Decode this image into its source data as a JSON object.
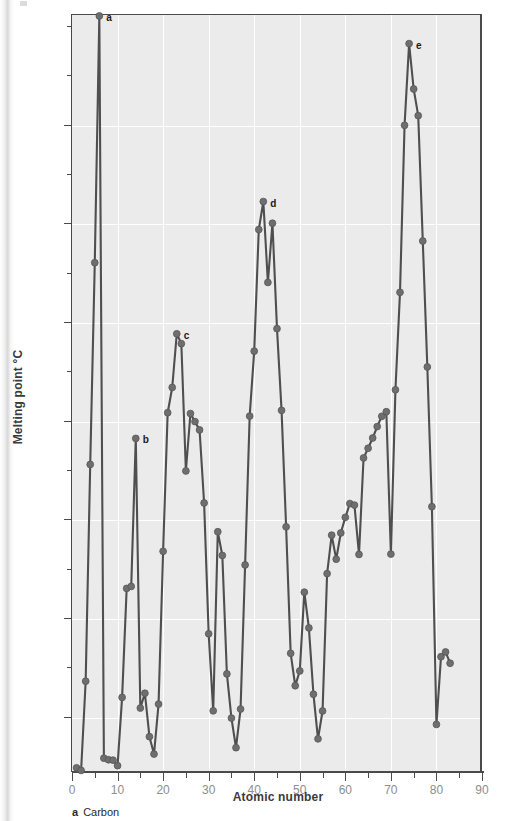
{
  "figure": {
    "caption_key": "a",
    "caption_text": "Carbon"
  },
  "chart_data": {
    "type": "line",
    "title": "",
    "xlabel": "Atomic number",
    "ylabel": "Melting point °C",
    "xlim": [
      0,
      90
    ],
    "ylim": [
      -280,
      3560
    ],
    "grid": true,
    "legend": "none",
    "x_major_ticks": [
      0,
      10,
      20,
      30,
      40,
      50,
      60,
      70,
      80,
      90
    ],
    "x_minor_ticks": [
      5,
      15,
      25,
      35,
      45,
      55,
      65,
      75,
      85
    ],
    "x_tick_labels": [
      "0",
      "10",
      "20",
      "30",
      "40",
      "50",
      "60",
      "70",
      "80",
      "90"
    ],
    "y_major_ticks": [
      0,
      500,
      1000,
      1500,
      2000,
      2500,
      3000
    ],
    "y_minor_ticks": [
      250,
      750,
      1250,
      1750,
      2250,
      2750,
      3250
    ],
    "y_tick_labels": [
      "0",
      "500",
      "1,000",
      "1,500",
      "2,000",
      "2,500",
      "3,000"
    ],
    "series_name": "Melting point",
    "marker_color": "#6e6e6e",
    "line_color": "#4f4f4f",
    "plot_background": "#ebebeb",
    "x": [
      1,
      2,
      3,
      4,
      5,
      6,
      7,
      8,
      9,
      10,
      11,
      12,
      13,
      14,
      15,
      16,
      17,
      18,
      19,
      20,
      21,
      22,
      23,
      24,
      25,
      26,
      27,
      28,
      29,
      30,
      31,
      32,
      33,
      34,
      35,
      36,
      37,
      38,
      39,
      40,
      41,
      42,
      43,
      44,
      45,
      46,
      47,
      48,
      49,
      50,
      51,
      52,
      53,
      54,
      55,
      56,
      57,
      58,
      59,
      60,
      61,
      62,
      63,
      64,
      65,
      66,
      67,
      68,
      69,
      70,
      71,
      72,
      73,
      74,
      75,
      76,
      77,
      78,
      79,
      80,
      81,
      82,
      83
    ],
    "y": [
      -259,
      -272,
      180,
      1278,
      2300,
      3550,
      -210,
      -218,
      -220,
      -248,
      98,
      650,
      660,
      1410,
      44,
      119,
      -101,
      -189,
      64,
      838,
      1540,
      1668,
      1940,
      1890,
      1245,
      1536,
      1495,
      1453,
      1083,
      420,
      30,
      937,
      817,
      217,
      -7,
      -157,
      39,
      769,
      1523,
      1852,
      2468,
      2610,
      2200,
      2500,
      1966,
      1552,
      962,
      321,
      157,
      232,
      631,
      450,
      114,
      -112,
      29,
      725,
      920,
      798,
      931,
      1010,
      1080,
      1072,
      822,
      1311,
      1360,
      1412,
      1470,
      1522,
      1545,
      824,
      1656,
      2150,
      2996,
      3410,
      3180,
      3045,
      2410,
      1772,
      1064,
      -39,
      304,
      328,
      271
    ],
    "annotated_points": [
      {
        "label": "a",
        "x": 6,
        "y": 3550,
        "element": "Carbon"
      },
      {
        "label": "b",
        "x": 14,
        "y": 1410,
        "element": "Silicon"
      },
      {
        "label": "c",
        "x": 23,
        "y": 1940,
        "element": "Vanadium"
      },
      {
        "label": "d",
        "x": 42,
        "y": 2610,
        "element": "Molybdenum"
      },
      {
        "label": "e",
        "x": 74,
        "y": 3410,
        "element": "Tungsten"
      }
    ]
  }
}
